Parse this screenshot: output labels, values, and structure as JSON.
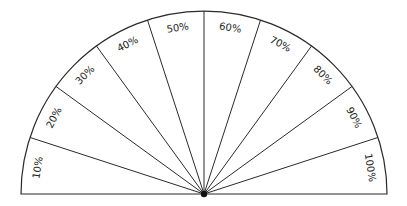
{
  "diagram": {
    "type": "semicircle-percentage-gauge",
    "center": [
      204,
      194
    ],
    "radius": 183,
    "label_inset": 15,
    "line_color": "#2a2a2a",
    "hub_color": "#111111",
    "sectors": [
      {
        "label": "10%"
      },
      {
        "label": "20%"
      },
      {
        "label": "30%"
      },
      {
        "label": "40%"
      },
      {
        "label": "50%"
      },
      {
        "label": "60%"
      },
      {
        "label": "70%"
      },
      {
        "label": "80%"
      },
      {
        "label": "90%"
      },
      {
        "label": "100%"
      }
    ]
  }
}
